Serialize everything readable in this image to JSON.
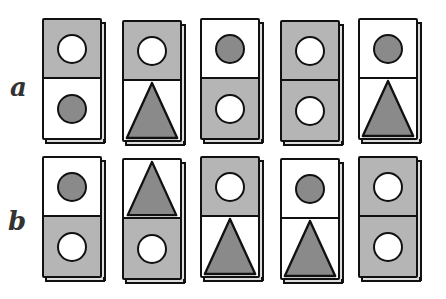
{
  "colors": {
    "grey_bg": "#b5b5b5",
    "white_bg": "#ffffff",
    "dark_shape": "#8a8a8a",
    "light_shape": "#ffffff",
    "outline": "#111111"
  },
  "rows": [
    {
      "label": "a",
      "tiles": [
        {
          "top": {
            "bg": "grey",
            "shape": "circle",
            "fill": "white"
          },
          "bottom": {
            "bg": "white",
            "shape": "circle",
            "fill": "dark"
          }
        },
        {
          "top": {
            "bg": "grey",
            "shape": "circle",
            "fill": "white"
          },
          "bottom": {
            "bg": "white",
            "shape": "triangle",
            "fill": "dark"
          }
        },
        {
          "top": {
            "bg": "white",
            "shape": "circle",
            "fill": "dark"
          },
          "bottom": {
            "bg": "grey",
            "shape": "circle",
            "fill": "white"
          }
        },
        {
          "top": {
            "bg": "grey",
            "shape": "circle",
            "fill": "white"
          },
          "bottom": {
            "bg": "grey",
            "shape": "circle",
            "fill": "white"
          }
        },
        {
          "top": {
            "bg": "white",
            "shape": "circle",
            "fill": "dark"
          },
          "bottom": {
            "bg": "white",
            "shape": "triangle",
            "fill": "dark"
          }
        }
      ]
    },
    {
      "label": "b",
      "tiles": [
        {
          "top": {
            "bg": "white",
            "shape": "circle",
            "fill": "dark"
          },
          "bottom": {
            "bg": "grey",
            "shape": "circle",
            "fill": "white"
          }
        },
        {
          "top": {
            "bg": "white",
            "shape": "triangle",
            "fill": "dark"
          },
          "bottom": {
            "bg": "grey",
            "shape": "circle",
            "fill": "white"
          }
        },
        {
          "top": {
            "bg": "grey",
            "shape": "circle",
            "fill": "white"
          },
          "bottom": {
            "bg": "white",
            "shape": "triangle",
            "fill": "dark"
          }
        },
        {
          "top": {
            "bg": "white",
            "shape": "circle",
            "fill": "dark"
          },
          "bottom": {
            "bg": "white",
            "shape": "triangle",
            "fill": "dark"
          }
        },
        {
          "top": {
            "bg": "grey",
            "shape": "circle",
            "fill": "white"
          },
          "bottom": {
            "bg": "grey",
            "shape": "circle",
            "fill": "white"
          }
        }
      ]
    }
  ]
}
